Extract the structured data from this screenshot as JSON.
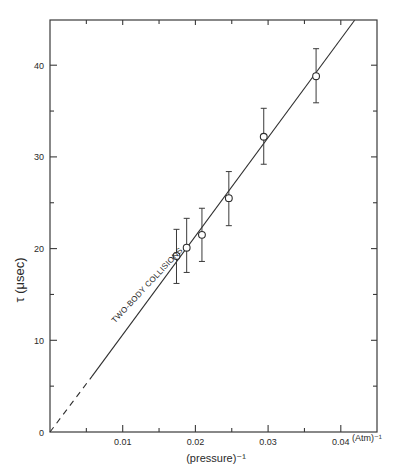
{
  "chart_data": {
    "type": "scatter",
    "title": "",
    "xlabel": "(pressure)⁻¹",
    "xunit": "(Atm)⁻¹",
    "ylabel": "τ (μsec)",
    "xlim": [
      0,
      0.045
    ],
    "ylim": [
      0,
      45
    ],
    "grid": false,
    "legend": null,
    "x_ticks": [
      {
        "value": 0.01,
        "label": "0.01"
      },
      {
        "value": 0.02,
        "label": "0.02"
      },
      {
        "value": 0.03,
        "label": "0.03"
      },
      {
        "value": 0.04,
        "label": "0.04"
      }
    ],
    "x_minor_ticks": [
      0.005,
      0.015,
      0.025,
      0.035
    ],
    "y_ticks": [
      {
        "value": 0,
        "label": "0"
      },
      {
        "value": 10,
        "label": "10"
      },
      {
        "value": 20,
        "label": "20"
      },
      {
        "value": 30,
        "label": "30"
      },
      {
        "value": 40,
        "label": "40"
      }
    ],
    "y_minor_ticks": [
      5,
      15,
      25,
      35
    ],
    "series": [
      {
        "name": "measured",
        "style": "open-circle-with-error-bars",
        "points": [
          {
            "x": 0.0174,
            "y": 19.2,
            "yerr_low": 16.2,
            "yerr_high": 22.1
          },
          {
            "x": 0.0188,
            "y": 20.1,
            "yerr_low": 17.4,
            "yerr_high": 23.3
          },
          {
            "x": 0.0209,
            "y": 21.5,
            "yerr_low": 18.6,
            "yerr_high": 24.4
          },
          {
            "x": 0.0246,
            "y": 25.5,
            "yerr_low": 22.5,
            "yerr_high": 28.4
          },
          {
            "x": 0.0294,
            "y": 32.2,
            "yerr_low": 29.2,
            "yerr_high": 35.3
          },
          {
            "x": 0.0366,
            "y": 38.8,
            "yerr_low": 35.9,
            "yerr_high": 41.8
          }
        ]
      },
      {
        "name": "linear fit",
        "style": "line",
        "segments": [
          {
            "style": "dashed",
            "from": {
              "x": 0,
              "y": 0
            },
            "to": {
              "x": 0.0058,
              "y": 6.1
            }
          },
          {
            "style": "solid",
            "from": {
              "x": 0.0058,
              "y": 6.1
            },
            "to": {
              "x": 0.0419,
              "y": 44.9
            }
          }
        ]
      }
    ],
    "annotations": [
      {
        "text": "TWO-BODY COLLISIONS",
        "x": 0.0095,
        "y": 11.5,
        "rotation_deg": -47,
        "underlined_by_line": true
      }
    ]
  }
}
